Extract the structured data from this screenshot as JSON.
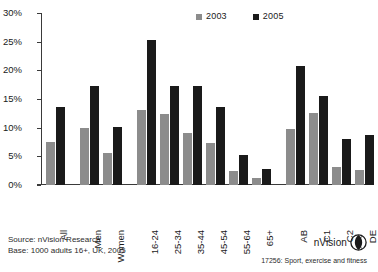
{
  "chart_data": {
    "type": "bar",
    "title": "",
    "xlabel": "",
    "ylabel": "",
    "ylim": [
      0,
      30
    ],
    "ytick_labels": [
      "0%",
      "5%",
      "10%",
      "15%",
      "20%",
      "25%",
      "30%"
    ],
    "ytick_values": [
      0,
      5,
      10,
      15,
      20,
      25,
      30
    ],
    "grid": false,
    "legend_position": "top-center",
    "categories": [
      "All",
      "Men",
      "Women",
      "16-24",
      "25-34",
      "35-44",
      "45-54",
      "55-64",
      "65+",
      "AB",
      "C1",
      "C2",
      "DE"
    ],
    "group_breaks_after": [
      "All",
      "Women",
      "65+"
    ],
    "series": [
      {
        "name": "2003",
        "color": "#8c8c8c",
        "values": [
          7.5,
          10.0,
          5.5,
          13.1,
          12.3,
          9.0,
          7.4,
          2.4,
          1.3,
          9.7,
          12.6,
          3.1,
          2.6
        ]
      },
      {
        "name": "2005",
        "color": "#1a1a1a",
        "values": [
          13.6,
          17.3,
          10.2,
          25.3,
          17.3,
          17.3,
          13.6,
          5.2,
          2.8,
          20.7,
          15.5,
          8.0,
          8.7
        ]
      }
    ]
  },
  "legend": {
    "items": [
      {
        "label": "2003",
        "color": "#8c8c8c"
      },
      {
        "label": "2005",
        "color": "#1a1a1a"
      }
    ]
  },
  "footer": {
    "source_line": "Source: nVision Research",
    "base_line": "Base: 1000 adults 16+, UK, 2005",
    "reference": "17256: Sport, exercise and fitness"
  },
  "brand": {
    "name": "nVision",
    "logo": "nvision-sphere-logo"
  },
  "colors": {
    "series_2003": "#8c8c8c",
    "series_2005": "#1a1a1a",
    "axis": "#3a3a3a",
    "background": "#ffffff"
  }
}
